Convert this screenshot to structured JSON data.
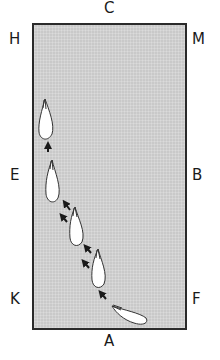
{
  "diagram": {
    "arena_fill": "#c9c9c9",
    "border_color": "#2a2a2a",
    "markers": {
      "top": "C",
      "bottom": "A",
      "left_top": "H",
      "left_mid": "E",
      "left_bottom": "K",
      "right_top": "M",
      "right_mid": "B",
      "right_bottom": "F"
    },
    "horse_positions": [
      {
        "label": "horse-1",
        "heading": "up"
      },
      {
        "label": "horse-2",
        "heading": "up-slight-left"
      },
      {
        "label": "horse-3",
        "heading": "up-left"
      },
      {
        "label": "horse-4",
        "heading": "up-left"
      },
      {
        "label": "horse-5",
        "heading": "left-up"
      }
    ],
    "arrow_groups": [
      {
        "label": "arrow-single",
        "count": 1
      },
      {
        "label": "arrows-double-upper",
        "count": 2
      },
      {
        "label": "arrows-double-lower",
        "count": 2
      },
      {
        "label": "arrows-double-bottom",
        "count": 2
      }
    ]
  }
}
